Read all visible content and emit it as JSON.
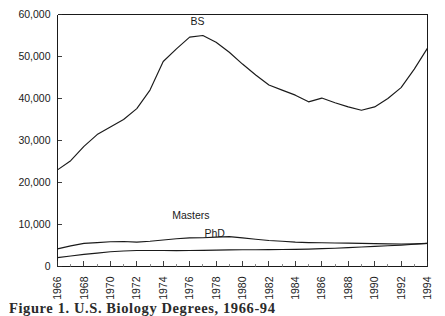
{
  "figure": {
    "caption": "Figure 1. U.S. Biology Degrees, 1966-94"
  },
  "chart_data": {
    "type": "line",
    "title": "",
    "subtitle": "",
    "xlabel": "",
    "ylabel": "",
    "xlim": [
      1966,
      1994
    ],
    "ylim": [
      0,
      60000
    ],
    "grid": false,
    "legend_position": "inline-annotations",
    "y_ticks": [
      0,
      10000,
      20000,
      30000,
      40000,
      50000,
      60000
    ],
    "y_tick_labels": [
      "0",
      "10,000",
      "20,000",
      "30,000",
      "40,000",
      "50,000",
      "60,000"
    ],
    "x_ticks": [
      1966,
      1968,
      1970,
      1972,
      1974,
      1976,
      1978,
      1980,
      1982,
      1984,
      1986,
      1988,
      1990,
      1992,
      1994
    ],
    "x_tick_labels": [
      "1966",
      "1968",
      "1970",
      "1972",
      "1974",
      "1976",
      "1978",
      "1980",
      "1982",
      "1984",
      "1986",
      "1988",
      "1990",
      "1992",
      "1994"
    ],
    "x_minor_step": 1,
    "x": [
      1966,
      1967,
      1968,
      1969,
      1970,
      1971,
      1972,
      1973,
      1974,
      1975,
      1976,
      1977,
      1978,
      1979,
      1980,
      1981,
      1982,
      1983,
      1984,
      1985,
      1986,
      1987,
      1988,
      1989,
      1990,
      1991,
      1992,
      1993,
      1994
    ],
    "series": [
      {
        "name": "BS",
        "label": "BS",
        "label_x": 1976.6,
        "label_y": 57600,
        "color": "#1a1a1a",
        "values": [
          23000,
          25200,
          28600,
          31400,
          33200,
          35000,
          37600,
          42000,
          48800,
          51800,
          54600,
          55000,
          53400,
          51000,
          48200,
          45600,
          43200,
          42000,
          40800,
          39200,
          40100,
          39000,
          38000,
          37200,
          38000,
          40000,
          42600,
          47000,
          52000
        ]
      },
      {
        "name": "Masters",
        "label": "Masters",
        "label_x": 1976.1,
        "label_y": 11400,
        "color": "#1a1a1a",
        "values": [
          4200,
          4900,
          5500,
          5700,
          5900,
          5950,
          5800,
          6000,
          6300,
          6600,
          6800,
          6850,
          7000,
          7100,
          6800,
          6500,
          6200,
          6000,
          5800,
          5700,
          5650,
          5600,
          5550,
          5500,
          5450,
          5400,
          5350,
          5400,
          5500
        ]
      },
      {
        "name": "PhD",
        "label": "PhD",
        "label_x": 1977.9,
        "label_y": 7100,
        "color": "#1a1a1a",
        "values": [
          2100,
          2500,
          2900,
          3200,
          3500,
          3700,
          3800,
          3820,
          3800,
          3780,
          3800,
          3850,
          3900,
          3950,
          3980,
          4000,
          4020,
          4050,
          4080,
          4150,
          4250,
          4350,
          4500,
          4650,
          4800,
          4950,
          5100,
          5300,
          5500
        ]
      }
    ]
  }
}
